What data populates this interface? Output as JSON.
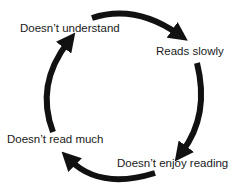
{
  "diagram": {
    "type": "cycle",
    "nodes": [
      {
        "id": "n1",
        "label": "Doesn’t understand"
      },
      {
        "id": "n2",
        "label": "Reads slowly"
      },
      {
        "id": "n3",
        "label": "Doesn’t enjoy reading"
      },
      {
        "id": "n4",
        "label": "Doesn’t read much"
      }
    ],
    "edges": [
      {
        "from": "n1",
        "to": "n2"
      },
      {
        "from": "n2",
        "to": "n3"
      },
      {
        "from": "n3",
        "to": "n4"
      },
      {
        "from": "n4",
        "to": "n1"
      }
    ],
    "colors": {
      "arrow": "#111111",
      "text": "#1a1a1a",
      "background": "#ffffff"
    }
  }
}
